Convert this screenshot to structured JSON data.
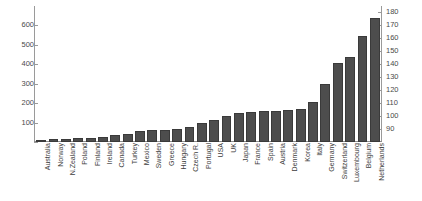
{
  "chart_data": {
    "type": "bar",
    "title": "",
    "xlabel": "",
    "ylabel": "",
    "grid": false,
    "legend": null,
    "categories": [
      "Australia",
      "Norway",
      "N.Zealand",
      "Poland",
      "Finland",
      "Ireland",
      "Canada",
      "Turkey",
      "Mexico",
      "Sweden",
      "Greece",
      "Hungary",
      "Czech R.",
      "Portugal",
      "USA",
      "UK",
      "Japan",
      "France",
      "Spain",
      "Austria",
      "Denmark",
      "Korea",
      "Italy",
      "Germany",
      "Switzerland",
      "Luxembourg",
      "Belgium",
      "Netherlands"
    ],
    "values": [
      8,
      14,
      16,
      20,
      22,
      24,
      36,
      42,
      58,
      60,
      62,
      66,
      76,
      96,
      112,
      134,
      150,
      155,
      158,
      158,
      165,
      168,
      205,
      300,
      405,
      440,
      545,
      636
    ],
    "ylim": [
      0,
      700
    ],
    "yticks": [
      0,
      100,
      200,
      300,
      400,
      500,
      600
    ],
    "ytick_labels": [
      "0",
      "100",
      "200",
      "300",
      "400",
      "500",
      "600"
    ],
    "y2lim": [
      80,
      185
    ],
    "y2ticks": [
      90,
      100,
      110,
      120,
      130,
      140,
      150,
      160,
      170,
      180
    ],
    "y2tick_labels": [
      "90",
      "100",
      "110",
      "120",
      "130",
      "140",
      "150",
      "160",
      "170",
      "180"
    ],
    "bar_color": "#4d4d4d"
  }
}
